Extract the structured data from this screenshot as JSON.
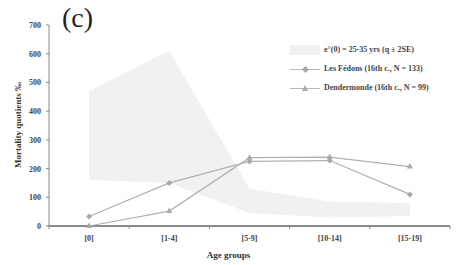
{
  "panel_label": "(c)",
  "chart_data": {
    "type": "line",
    "title": "",
    "xlabel": "Age groups",
    "ylabel": "Mortality quotients ‰",
    "ylim": [
      0,
      700
    ],
    "yticks": [
      0,
      100,
      200,
      300,
      400,
      500,
      600,
      700
    ],
    "categories": [
      "[0]",
      "[1-4]",
      "[5-9]",
      "[10-14]",
      "[15-19]"
    ],
    "band": {
      "name": "e°(0) = 25-35 yrs (q ± 2SE)",
      "upper": [
        470,
        610,
        130,
        85,
        80
      ],
      "lower": [
        160,
        150,
        45,
        30,
        35
      ],
      "color": "#f1f1f1"
    },
    "series": [
      {
        "name": "Les Fédons (16th c., N = 133)",
        "marker": "diamond",
        "values": [
          33,
          150,
          225,
          228,
          110
        ],
        "color": "#b0b0b0"
      },
      {
        "name": "Dendermonde (16th c., N = 99)",
        "marker": "triangle",
        "values": [
          0,
          52,
          238,
          240,
          207
        ],
        "color": "#b0b0b0"
      }
    ],
    "grid": false,
    "legend_position": "upper right"
  },
  "legend": {
    "items": [
      {
        "label": "e°(0) = 25-35 yrs (q ± 2SE)"
      },
      {
        "label": "Les Fédons (16th c., N = 133)"
      },
      {
        "label": "Dendermonde (16th c., N = 99)"
      }
    ]
  }
}
